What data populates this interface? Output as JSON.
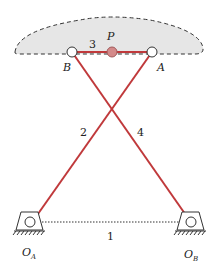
{
  "diagram": {
    "type": "four-bar linkage (crossed)",
    "coupler_region": {
      "fill": "#e6e6e6",
      "stroke": "#333333",
      "style": "dashed"
    },
    "link_color": "#c0393b",
    "ground_color": "#333333",
    "points": {
      "P": {
        "label": "P",
        "fill": "#d48a8a"
      },
      "A": {
        "label": "A"
      },
      "B": {
        "label": "B"
      },
      "O_A": {
        "label": "O",
        "sub": "A"
      },
      "O_B": {
        "label": "O",
        "sub": "B"
      }
    },
    "links": {
      "ground": {
        "label": "1"
      },
      "crank": {
        "label": "2"
      },
      "coupler": {
        "label": "3"
      },
      "rocker": {
        "label": "4"
      }
    }
  }
}
